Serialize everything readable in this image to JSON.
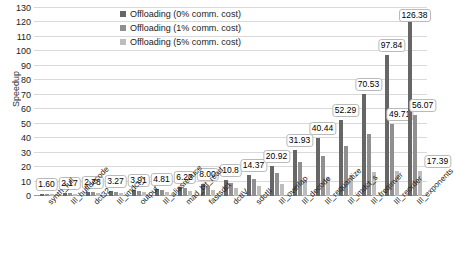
{
  "chart_data": {
    "type": "bar",
    "title": "",
    "xlabel": "",
    "ylabel": "Speedup",
    "ylim": [
      0,
      130
    ],
    "ytick_step": 10,
    "yticks": [
      0,
      10,
      20,
      30,
      40,
      50,
      60,
      70,
      80,
      90,
      100,
      110,
      120,
      130
    ],
    "grid": true,
    "legend_position": "top-center",
    "categories": [
      "synth_full",
      "IIl_huffdecode",
      "dct32",
      "IIl_imdct_l",
      "output",
      "IIl_aliasreduce",
      "mad_bit_read",
      "fastsdct",
      "dctIV",
      "sdctII",
      "IIl_overlap",
      "IIl_decode",
      "IIl_requantize",
      "IIl_imdct_s",
      "IIl_freqinver",
      "IIl_reorder",
      "IIl_exponents"
    ],
    "series": [
      {
        "name": "Offloading (0% comm. cost)",
        "color": "#666666",
        "values": [
          1.6,
          2.17,
          2.78,
          3.27,
          3.91,
          4.81,
          6.22,
          8.0,
          10.8,
          14.37,
          20.92,
          31.93,
          40.44,
          52.29,
          70.53,
          97.84,
          126.38
        ]
      },
      {
        "name": "Offloading (1% comm. cost)",
        "color": "#8f8f8f",
        "values": [
          1.5,
          2.02,
          2.58,
          3.0,
          3.55,
          4.32,
          5.49,
          6.9,
          9.1,
          11.7,
          16.2,
          23.2,
          27.9,
          34.3,
          43.0,
          49.71,
          56.07
        ]
      },
      {
        "name": "Offloading (5% comm. cost)",
        "color": "#bdbdbd",
        "values": [
          1.22,
          1.6,
          1.98,
          2.25,
          2.6,
          3.05,
          3.7,
          4.45,
          5.55,
          6.7,
          8.6,
          11.3,
          12.8,
          14.6,
          16.4,
          17.1,
          17.39
        ]
      }
    ],
    "value_labels": [
      "1.60",
      "2.17",
      "2.78",
      "3.27",
      "3.91",
      "4.81",
      "6.22",
      "8.00",
      "10.8",
      "14.37",
      "20.92",
      "31.93",
      "40.44",
      "52.29",
      "70.53",
      "97.84",
      "126.38"
    ],
    "extra_value_labels": [
      {
        "category": "IIl_reorder",
        "value": 49.71,
        "text": "49.71"
      },
      {
        "category": "IIl_exponents",
        "value": 56.07,
        "text": "56.07"
      },
      {
        "category": "IIl_exponents",
        "value": 17.39,
        "text": "17.39"
      }
    ]
  },
  "legend": {
    "items": [
      {
        "label": "Offloading (0% comm. cost)"
      },
      {
        "label": "Offloading (1% comm. cost)"
      },
      {
        "label": "Offloading (5% comm. cost)"
      }
    ]
  },
  "axis": {
    "y_title": "Speedup"
  },
  "footer": {
    "mark": ""
  }
}
